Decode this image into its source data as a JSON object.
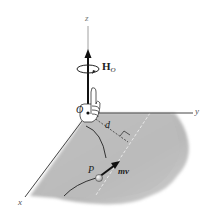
{
  "figure": {
    "type": "angular-momentum-diagram",
    "labels": {
      "z_axis": "z",
      "y_axis": "y",
      "x_axis": "x",
      "origin": "O",
      "angular_momentum": "H",
      "angular_momentum_subscript": "O",
      "distance": "d",
      "particle": "P",
      "linear_momentum": "mv"
    },
    "icons": [
      "right-hand-rule-hand",
      "circular-rotation-arrow",
      "particle-sphere"
    ],
    "colors": {
      "axis": "#333333",
      "plane": "#bdbdbd",
      "plane_light": "#e4e4e4",
      "vector": "#111111",
      "particle": "#f0f0f0"
    }
  }
}
